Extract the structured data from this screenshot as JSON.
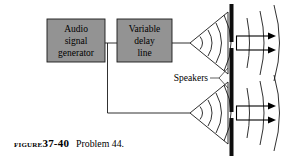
{
  "figure": {
    "caption_prefix": "Figure",
    "caption_number": "37-40",
    "caption_text": "Problem 44."
  },
  "blocks": [
    {
      "id": "audio-signal-generator",
      "lines": [
        "Audio",
        "signal",
        "generator"
      ],
      "fill": "#939393",
      "stroke": "#1a1a1a"
    },
    {
      "id": "variable-delay-line",
      "lines": [
        "Variable",
        "delay",
        "line"
      ],
      "fill": "#939393",
      "stroke": "#1a1a1a"
    }
  ],
  "annotations": {
    "speakers_label": "Speakers"
  },
  "colors": {
    "background": "#ffffff",
    "ink": "#000000",
    "block_fill": "#939393",
    "barrier": "#0d0d0d",
    "wire": "#1a1a1a"
  },
  "elements": {
    "speaker_count": 2,
    "slit_count": 2,
    "arrow_count": 4
  }
}
